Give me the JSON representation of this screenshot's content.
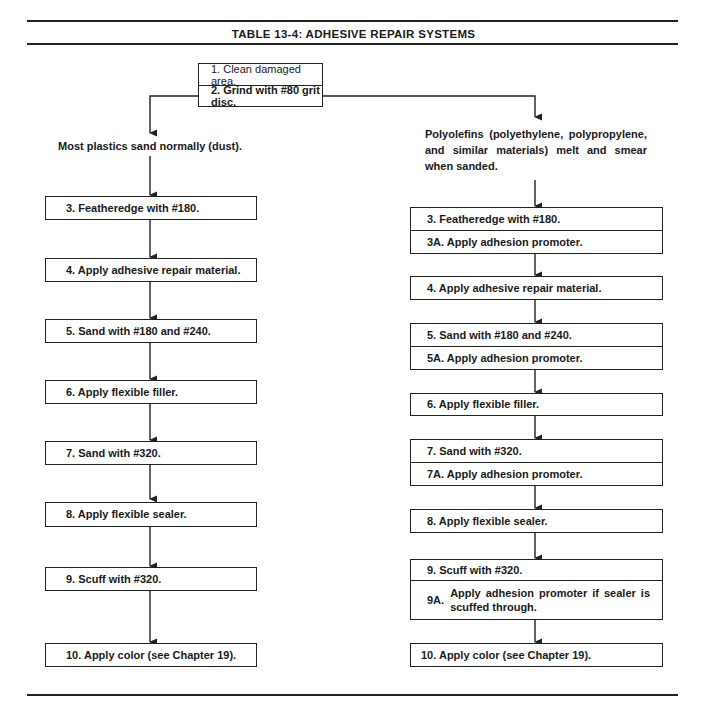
{
  "table": {
    "title": "TABLE 13-4:   ADHESIVE REPAIR SYSTEMS"
  },
  "start": {
    "step1": "1.  Clean damaged area.",
    "step2": "2.  Grind with #80 grit disc."
  },
  "left_branch": {
    "condition": "Most plastics sand normally (dust).",
    "steps": [
      "3.  Featheredge with #180.",
      "4.  Apply adhesive repair material.",
      "5.  Sand with #180 and #240.",
      "6.  Apply flexible filler.",
      "7.  Sand with #320.",
      "8.  Apply flexible sealer.",
      "9.  Scuff with #320.",
      "10.  Apply color (see Chapter 19)."
    ]
  },
  "right_branch": {
    "condition": "Polyolefins (polyethylene, polypropylene, and similar materials) melt and smear when sanded.",
    "steps": {
      "s3": "3.  Featheredge with #180.",
      "s3a": "3A.  Apply adhesion promoter.",
      "s4": "4.  Apply adhesive repair material.",
      "s5": "5.  Sand with #180 and #240.",
      "s5a": "5A.  Apply adhesion promoter.",
      "s6": "6.  Apply flexible filler.",
      "s7": "7.  Sand with #320.",
      "s7a": "7A.  Apply adhesion promoter.",
      "s8": "8.  Apply flexible sealer.",
      "s9": "9.  Scuff with #320.",
      "s9a_num": "9A.",
      "s9a_text": "Apply adhesion promoter if sealer is scuffed through.",
      "s10": "10.  Apply color (see Chapter 19)."
    }
  }
}
